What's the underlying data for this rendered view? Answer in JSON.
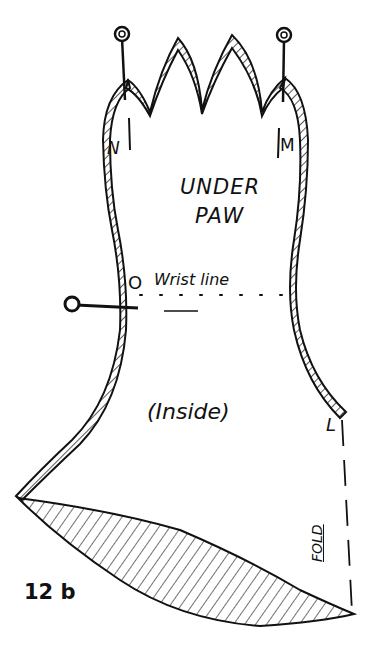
{
  "figure": {
    "number": "12 b",
    "colors": {
      "ink": "#111111",
      "paper": "#ffffff"
    }
  },
  "labels": {
    "title_line1": "UNDER",
    "title_line2": "PAW",
    "point_n": "N",
    "point_m": "M",
    "point_o": "O",
    "wrist_line": "Wrist line",
    "inside": "(Inside)",
    "point_l": "L",
    "fold": "FOLD",
    "figure_number": "12 b"
  },
  "elements": {
    "pins": [
      "pin-top-left",
      "pin-top-right",
      "pin-wrist-left"
    ],
    "hatched_regions": [
      "scalloped-finger-tips",
      "left-seam-allowance",
      "right-seam-allowance",
      "bottom-curved-dart"
    ],
    "dotted_line": "wrist-line",
    "dashed_line": "fold-line"
  }
}
